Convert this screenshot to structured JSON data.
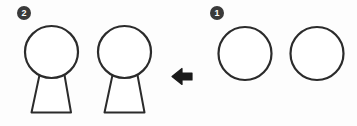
{
  "diagram": {
    "background_color": "#fdfdfd",
    "stroke_color": "#2b2b2b",
    "fill_color": "#ffffff",
    "arrow_color": "#1a1a1a",
    "marker_fill_color": "#3a3a3a",
    "marker_text_color": "#ffffff"
  },
  "steps": [
    {
      "id": "step-1",
      "marker_label": "1",
      "name": "initial-state",
      "shape_count": 2,
      "shapes": [
        {
          "name": "circle-right-a",
          "type": "circle",
          "cx": 245,
          "cy": 53,
          "r": 26
        },
        {
          "name": "circle-right-b",
          "type": "circle",
          "cx": 317,
          "cy": 53,
          "r": 26
        }
      ]
    },
    {
      "id": "step-2",
      "marker_label": "2",
      "name": "transformed-state",
      "shape_count": 2,
      "shapes": [
        {
          "name": "figure-left-a",
          "type": "circle-with-trapezoid-body",
          "head": {
            "cx": 51,
            "cy": 52,
            "r": 26
          },
          "body": {
            "top_left_x": 39,
            "top_right_x": 64,
            "top_y": 76,
            "bottom_left_x": 31,
            "bottom_right_x": 71,
            "bottom_y": 113
          }
        },
        {
          "name": "figure-left-b",
          "type": "circle-with-trapezoid-body",
          "head": {
            "cx": 124,
            "cy": 52,
            "r": 26
          },
          "body": {
            "top_left_x": 112,
            "top_right_x": 137,
            "top_y": 76,
            "bottom_left_x": 104,
            "bottom_right_x": 144,
            "bottom_y": 113
          }
        }
      ]
    }
  ],
  "arrow": {
    "name": "transformation-arrow",
    "direction": "left",
    "x": 172,
    "y": 68,
    "width": 20,
    "height": 17,
    "label": ""
  }
}
